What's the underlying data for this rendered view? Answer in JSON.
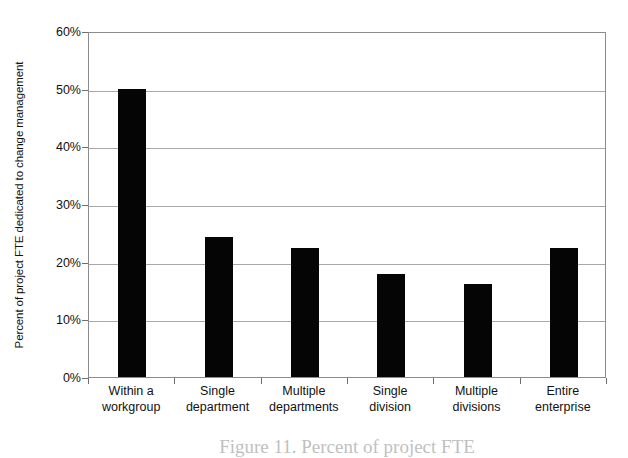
{
  "chart_data": {
    "type": "bar",
    "title": "",
    "xlabel": "",
    "ylabel": "Percent of project FTE dedicated to change management",
    "categories": [
      "Within a workgroup",
      "Single department",
      "Multiple departments",
      "Single division",
      "Multiple divisions",
      "Entire enterprise"
    ],
    "category_lines": [
      [
        "Within a",
        "workgroup"
      ],
      [
        "Single",
        "department"
      ],
      [
        "Multiple",
        "departments"
      ],
      [
        "Single",
        "division"
      ],
      [
        "Multiple",
        "divisions"
      ],
      [
        "Entire",
        "enterprise"
      ]
    ],
    "values": [
      50.0,
      24.2,
      22.3,
      17.8,
      16.2,
      22.3
    ],
    "ylim": [
      0,
      60
    ],
    "ytick_values": [
      0,
      10,
      20,
      30,
      40,
      50,
      60
    ],
    "ytick_labels": [
      "0%",
      "10%",
      "20%",
      "30%",
      "40%",
      "50%",
      "60%"
    ],
    "grid": "horizontal",
    "legend": "none",
    "bar_color": "#050505",
    "gridline_color": "#a8a8a8",
    "axis_color": "#8c8c8c",
    "background_color": "#ffffff"
  },
  "caption": {
    "text": "Figure 11. Percent of project FTE",
    "note": "clipped at bottom edge of image"
  }
}
